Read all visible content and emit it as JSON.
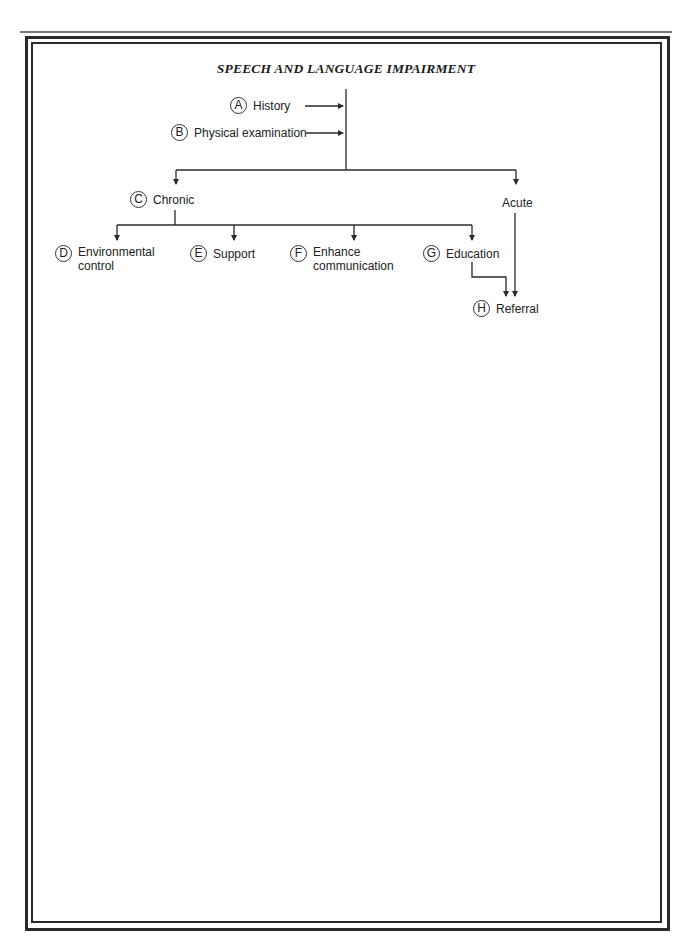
{
  "title": "SPEECH AND LANGUAGE IMPAIRMENT",
  "nodes": {
    "a": {
      "letter": "A",
      "label": "History"
    },
    "b": {
      "letter": "B",
      "label": "Physical examination"
    },
    "c": {
      "letter": "C",
      "label": "Chronic"
    },
    "acute": {
      "label": "Acute"
    },
    "d": {
      "letter": "D",
      "label_line1": "Environmental",
      "label_line2": "control"
    },
    "e": {
      "letter": "E",
      "label": "Support"
    },
    "f": {
      "letter": "F",
      "label_line1": "Enhance",
      "label_line2": "communication"
    },
    "g": {
      "letter": "G",
      "label": "Education"
    },
    "h": {
      "letter": "H",
      "label": "Referral"
    }
  },
  "colors": {
    "line": "#2a2a2a",
    "text": "#222222",
    "background": "#ffffff"
  }
}
